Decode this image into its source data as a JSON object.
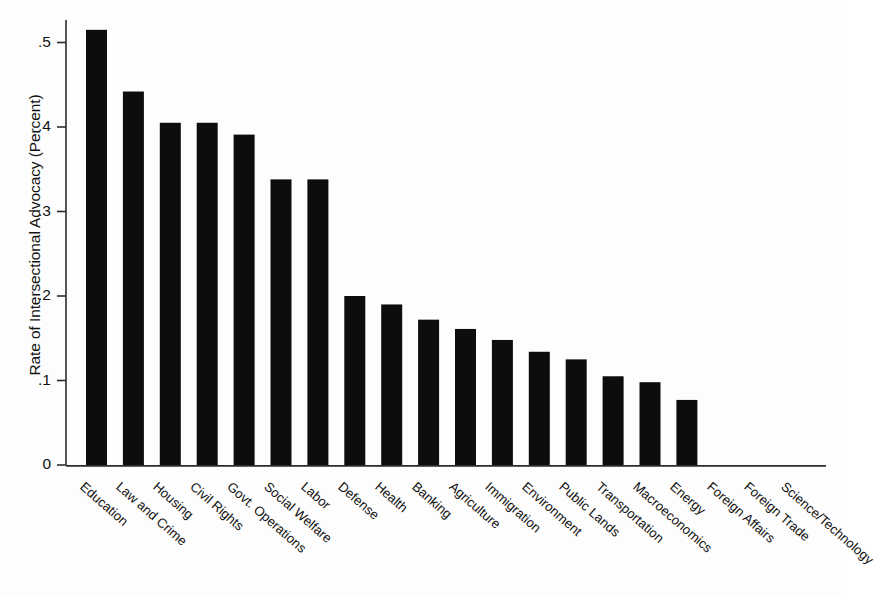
{
  "chart_data": {
    "type": "bar",
    "title": "",
    "xlabel": "",
    "ylabel": "Rate of Intersectional Advocacy (Percent)",
    "ylim": [
      0,
      0.53
    ],
    "ytick_values": [
      0,
      0.1,
      0.2,
      0.3,
      0.4,
      0.5
    ],
    "ytick_labels": [
      "0",
      ".1",
      ".2",
      ".3",
      ".4",
      ".5"
    ],
    "grid": false,
    "legend": null,
    "bar_color": "#0d0d0d",
    "categories": [
      "Education",
      "Law and Crime",
      "Housing",
      "Civil Rights",
      "Govt. Operations",
      "Social Welfare",
      "Labor",
      "Defense",
      "Health",
      "Banking",
      "Agriculture",
      "Immigration",
      "Environment",
      "Public Lands",
      "Transportation",
      "Macroeconomics",
      "Energy",
      "Foreign Affairs",
      "Foreign Trade",
      "Science/Technology"
    ],
    "values": [
      0.515,
      0.442,
      0.405,
      0.405,
      0.391,
      0.338,
      0.338,
      0.2,
      0.19,
      0.172,
      0.161,
      0.148,
      0.134,
      0.125,
      0.105,
      0.098,
      0.077,
      0.0,
      0.0,
      0.0
    ]
  },
  "axis": {
    "y_title": "Rate of Intersectional Advocacy (Percent)"
  }
}
